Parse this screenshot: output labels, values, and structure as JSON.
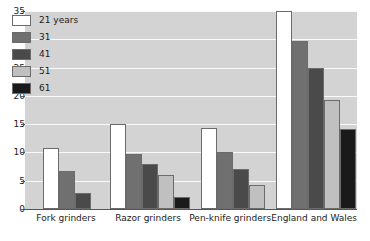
{
  "chart_data": {
    "type": "bar",
    "title": "",
    "subtitle": "",
    "xlabel": "",
    "ylabel": "",
    "ylim": [
      0,
      35
    ],
    "yticks": [
      0,
      5,
      10,
      15,
      20,
      25,
      30,
      35
    ],
    "grid": true,
    "legend_position": "inside-top-left",
    "categories": [
      "Fork grinders",
      "Razor grinders",
      "Pen-knife grinders",
      "England and Wales"
    ],
    "series": [
      {
        "name": "21 years",
        "color": "#ffffff",
        "values": [
          10.7,
          15.0,
          14.3,
          35.0
        ]
      },
      {
        "name": "31",
        "color": "#707070",
        "values": [
          6.7,
          9.7,
          10.0,
          29.7
        ]
      },
      {
        "name": "41",
        "color": "#4a4a4a",
        "values": [
          2.9,
          8.0,
          7.0,
          25.0
        ]
      },
      {
        "name": "51",
        "color": "#c0c0c0",
        "values": [
          null,
          6.0,
          4.2,
          19.2
        ]
      },
      {
        "name": "61",
        "color": "#1a1a1a",
        "values": [
          null,
          2.2,
          null,
          14.2
        ]
      }
    ],
    "plot_background": "#d3d3d3",
    "gridline_color": "#fafafa",
    "axis_color": "#555555",
    "bar_border_color": "#6b6b6b"
  }
}
